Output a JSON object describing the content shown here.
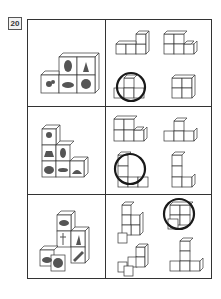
{
  "item_number": "20",
  "rows": [
    {
      "stack_pictures": [
        "chick",
        "pinecone",
        "strawberry-plant",
        "flowers-basket",
        "bouquet"
      ],
      "stack_layout": "2 on top-right, 3 on bottom",
      "options": [
        {
          "shape": "L-3-bottom-1-top-right",
          "correct": false
        },
        {
          "shape": "2-top-3-bottom-right",
          "correct": false
        },
        {
          "shape": "1-top-center-3-bottom",
          "correct": true
        },
        {
          "shape": "2x2-square",
          "correct": false
        }
      ]
    },
    {
      "stack_pictures": [
        "clock",
        "deer",
        "hedgehog-shell",
        "hedgehog",
        "dolphin",
        "porcupine"
      ],
      "stack_layout": "staircase 1-2-3",
      "options": [
        {
          "shape": "2-top-3-bottom-left",
          "correct": false
        },
        {
          "shape": "1-top-center-3-bottom",
          "correct": false
        },
        {
          "shape": "staircase-L-2-tall-3-wide",
          "correct": true
        },
        {
          "shape": "tall-L-3-tall-2-wide",
          "correct": false
        }
      ]
    },
    {
      "stack_pictures": [
        "watermelon",
        "dragonfly",
        "giraffe",
        "turtle",
        "melon",
        "pencil"
      ],
      "stack_layout": "pyramid offset",
      "options": [
        {
          "shape": "zigzag-tower",
          "correct": false
        },
        {
          "shape": "2-top-offset-1-front",
          "correct": true
        },
        {
          "shape": "diagonal-steps",
          "correct": false
        },
        {
          "shape": "T-tower-3-tall-3-wide",
          "correct": false
        }
      ]
    }
  ]
}
